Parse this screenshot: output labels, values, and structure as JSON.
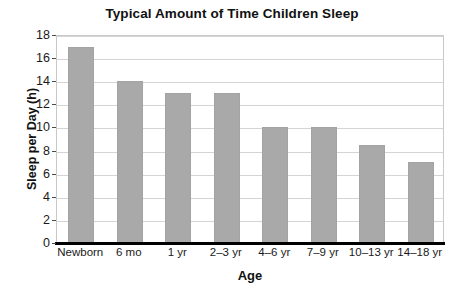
{
  "chart_data": {
    "type": "bar",
    "title": "Typical Amount of Time Children Sleep",
    "xlabel": "Age",
    "ylabel": "Sleep per Day (h)",
    "categories": [
      "Newborn",
      "6 mo",
      "1 yr",
      "2–3 yr",
      "4–6 yr",
      "7–9 yr",
      "10–13 yr",
      "14–18 yr"
    ],
    "values": [
      17,
      14,
      13,
      13,
      10,
      10,
      8.5,
      7
    ],
    "ylim": [
      0,
      18
    ],
    "ytick_step": 2,
    "yticks": [
      0,
      2,
      4,
      6,
      8,
      10,
      12,
      14,
      16,
      18
    ],
    "ytick_labels": [
      "0",
      "2",
      "4",
      "6",
      "8",
      "10",
      "12",
      "14",
      "16",
      "18"
    ],
    "grid": true,
    "grid_axis": "y",
    "legend": false,
    "legend_position": "none",
    "bar_color": "#a9a9a9",
    "gridline_color": "#d4d4d4",
    "axis_color": "#000000",
    "background_color": "#ffffff",
    "text_color": "#111111"
  }
}
